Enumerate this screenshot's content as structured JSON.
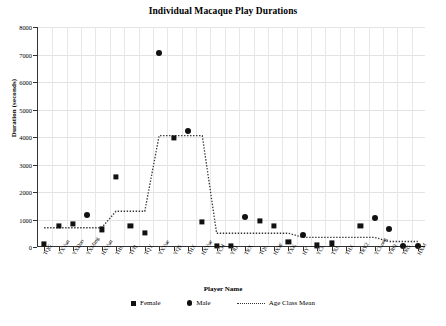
{
  "chart_data": {
    "type": "scatter",
    "title": "Individual Macaque Play Durations",
    "xlabel": "Player Name",
    "ylabel": "Duration (seconds)",
    "ylim": [
      0,
      8000
    ],
    "ytick_labels": [
      "0",
      "1000",
      "2000",
      "3000",
      "4000",
      "5000",
      "6000",
      "7000",
      "8000"
    ],
    "ytick_values": [
      0,
      1000,
      2000,
      3000,
      4000,
      5000,
      6000,
      7000,
      8000
    ],
    "grid": true,
    "legend_position": "bottom",
    "categories": [
      "TQG",
      "YXYun",
      "YXDuo",
      "YXMing",
      "HXYun",
      "THL",
      "TFH",
      "TQY",
      "YXYue",
      "YQS",
      "THX",
      "HXYue",
      "YCH",
      "YRJ",
      "TRX",
      "TQL",
      "HXW",
      "YXK",
      "HY",
      "YCL",
      "TXL",
      "THX",
      "TRY2",
      "YCLong",
      "YRQ",
      "TRG",
      "HXM"
    ],
    "series": [
      {
        "name": "Female",
        "marker": "square",
        "color": "#111111",
        "points": [
          {
            "category": "TQG",
            "value": 120
          },
          {
            "category": "YXYun",
            "value": 760
          },
          {
            "category": "YXDuo",
            "value": 840
          },
          {
            "category": "HXYun",
            "value": 640
          },
          {
            "category": "THL",
            "value": 2560
          },
          {
            "category": "TFH",
            "value": 780
          },
          {
            "category": "TQY",
            "value": 520
          },
          {
            "category": "YQS",
            "value": 3960
          },
          {
            "category": "HXYue",
            "value": 900
          },
          {
            "category": "YCH",
            "value": 40
          },
          {
            "category": "YRJ",
            "value": 30
          },
          {
            "category": "TQL",
            "value": 960
          },
          {
            "category": "HXW",
            "value": 760
          },
          {
            "category": "YXK",
            "value": 190
          },
          {
            "category": "YCL",
            "value": 60
          },
          {
            "category": "TXL",
            "value": 130
          },
          {
            "category": "TRY2",
            "value": 780
          }
        ]
      },
      {
        "name": "Male",
        "marker": "circle",
        "color": "#111111",
        "points": [
          {
            "category": "YXMing",
            "value": 1180
          },
          {
            "category": "YXYue",
            "value": 7040
          },
          {
            "category": "THX",
            "value": 4220
          },
          {
            "category": "TRX",
            "value": 1080
          },
          {
            "category": "HY",
            "value": 420
          },
          {
            "category": "YCLong",
            "value": 1060
          },
          {
            "category": "YRQ",
            "value": 640
          },
          {
            "category": "TRG",
            "value": 30
          },
          {
            "category": "HXM",
            "value": 30
          }
        ]
      }
    ],
    "mean_line": {
      "name": "Age Class Mean",
      "style": "dotted",
      "color": "#333333",
      "values": [
        700,
        700,
        700,
        700,
        700,
        1300,
        1300,
        1300,
        4050,
        4050,
        4050,
        4050,
        500,
        500,
        500,
        500,
        500,
        500,
        350,
        350,
        350,
        350,
        350,
        350,
        200,
        200,
        200
      ]
    }
  },
  "legend": {
    "items": [
      {
        "label": "Female",
        "glyph": "square-marker"
      },
      {
        "label": "Male",
        "glyph": "circle-marker"
      },
      {
        "label": "Age Class Mean",
        "glyph": "dotted-line"
      }
    ]
  }
}
